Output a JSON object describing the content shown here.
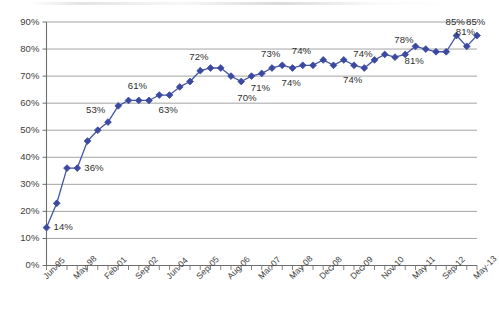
{
  "chart_data": {
    "type": "line",
    "title": "",
    "subtitle": "",
    "xlabel": "",
    "ylabel": "",
    "ylim": [
      0,
      90
    ],
    "ytick_step": 10,
    "grid": true,
    "legend": false,
    "marker": "diamond",
    "series_color": "#3b4aa0",
    "line_color": "#4455a5",
    "gridline_color": "#9a9a9a",
    "axis_color": "#6e6e6e",
    "y_ticks": [
      "0%",
      "10%",
      "20%",
      "30%",
      "40%",
      "50%",
      "60%",
      "70%",
      "80%",
      "90%"
    ],
    "x_ticks": [
      "Jun-95",
      "May-98",
      "Feb-01",
      "Sep-02",
      "Jun-04",
      "Sep-05",
      "Aug-06",
      "Mar-07",
      "May-08",
      "Dec-08",
      "Dec-09",
      "Nov-10",
      "May-11",
      "Sep-12",
      "May-13"
    ],
    "x_tick_indices": [
      0,
      3,
      6,
      9,
      12,
      15,
      18,
      21,
      24,
      27,
      30,
      33,
      36,
      39,
      42
    ],
    "values": [
      14,
      23,
      36,
      36,
      46,
      50,
      53,
      59,
      61,
      61,
      61,
      63,
      63,
      66,
      68,
      72,
      73,
      73,
      70,
      68,
      70,
      71,
      73,
      74,
      73,
      74,
      74,
      76,
      74,
      76,
      74,
      73,
      76,
      78,
      77,
      78,
      81,
      80,
      79,
      79,
      85,
      81,
      85
    ],
    "point_labels": [
      {
        "index": 0,
        "text": "14%",
        "placement": "right"
      },
      {
        "index": 3,
        "text": "36%",
        "placement": "right"
      },
      {
        "index": 6,
        "text": "53%",
        "placement": "above-left"
      },
      {
        "index": 9,
        "text": "61%",
        "placement": "above"
      },
      {
        "index": 12,
        "text": "63%",
        "placement": "below"
      },
      {
        "index": 15,
        "text": "72%",
        "placement": "above"
      },
      {
        "index": 19,
        "text": "70%",
        "placement": "below-right"
      },
      {
        "index": 22,
        "text": "73%",
        "placement": "above"
      },
      {
        "index": 21,
        "text": "71%",
        "placement": "below"
      },
      {
        "index": 25,
        "text": "74%",
        "placement": "above"
      },
      {
        "index": 24,
        "text": "74%",
        "placement": "below"
      },
      {
        "index": 30,
        "text": "74%",
        "placement": "below"
      },
      {
        "index": 31,
        "text": "74%",
        "placement": "above"
      },
      {
        "index": 35,
        "text": "78%",
        "placement": "above"
      },
      {
        "index": 36,
        "text": "81%",
        "placement": "below"
      },
      {
        "index": 40,
        "text": "85%",
        "placement": "above"
      },
      {
        "index": 41,
        "text": "81%",
        "placement": "above"
      },
      {
        "index": 42,
        "text": "85%",
        "placement": "above"
      }
    ]
  }
}
